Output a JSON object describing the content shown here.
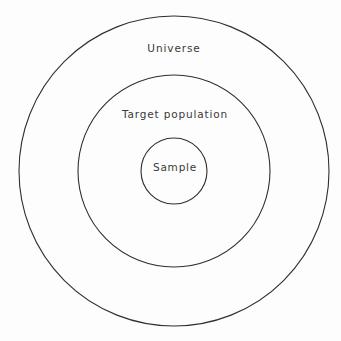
{
  "diagram": {
    "type": "nested-circles",
    "background_color": "#fdfdfd",
    "stroke_color": "#2f2f2f",
    "text_color": "#3a3a3a",
    "center": {
      "x": 174,
      "y": 171
    },
    "rings": [
      {
        "id": "universe",
        "label": "Universe",
        "diameter": 310,
        "radius": 155,
        "label_x": 174,
        "label_y": 48
      },
      {
        "id": "target-population",
        "label": "Target population",
        "diameter": 192,
        "radius": 96,
        "label_x": 175,
        "label_y": 114
      },
      {
        "id": "sample",
        "label": "Sample",
        "diameter": 66,
        "radius": 33,
        "label_x": 175,
        "label_y": 167
      }
    ]
  }
}
